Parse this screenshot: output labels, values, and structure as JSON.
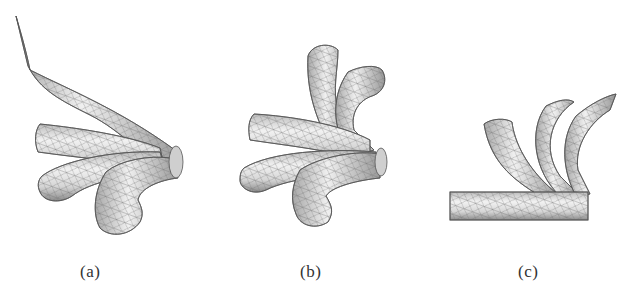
{
  "figure": {
    "panels": [
      {
        "id": "a",
        "label": "(a)",
        "description": "wireframe tube mesh with long swept tube and three short bent tubes meeting at a junction"
      },
      {
        "id": "b",
        "label": "(b)",
        "description": "wireframe tube mesh with five bent tubes radiating from a junction"
      },
      {
        "id": "c",
        "label": "(c)",
        "description": "horizontal straight tube with three curved tubes rising from it"
      }
    ]
  },
  "colors": {
    "tube_fill": "#e4e4e4",
    "tube_shade": "#9a9a9a",
    "mesh_line": "#6a6a6a",
    "label_text": "#333333",
    "background": "#ffffff"
  }
}
